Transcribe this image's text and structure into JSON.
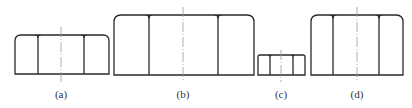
{
  "figure": {
    "stroke_color": "#2a2a2a",
    "centerline_color": "#9a9a9a",
    "panels": [
      {
        "id": "a",
        "label": "(a)",
        "x": 15,
        "y": 35,
        "w": 94,
        "h": 39,
        "inner": [
          38,
          84
        ],
        "cx": 61,
        "cl_top": 27,
        "cl_bottom": 82,
        "r": 6
      },
      {
        "id": "b",
        "label": "(b)",
        "x": 114,
        "y": 15,
        "w": 140,
        "h": 60,
        "inner": [
          149,
          218
        ],
        "cx": 183,
        "cl_top": 7,
        "cl_bottom": 82,
        "r": 7
      },
      {
        "id": "c",
        "label": "(c)",
        "x": 258,
        "y": 55,
        "w": 47,
        "h": 20,
        "inner": [
          270,
          293
        ],
        "cx": 281,
        "cl_top": 50,
        "cl_bottom": 82,
        "r": 2
      },
      {
        "id": "d",
        "label": "(d)",
        "x": 311,
        "y": 15,
        "w": 92,
        "h": 60,
        "inner": [
          333,
          379
        ],
        "cx": 357,
        "cl_top": 7,
        "cl_bottom": 82,
        "r": 7
      }
    ],
    "label_y": 98
  }
}
